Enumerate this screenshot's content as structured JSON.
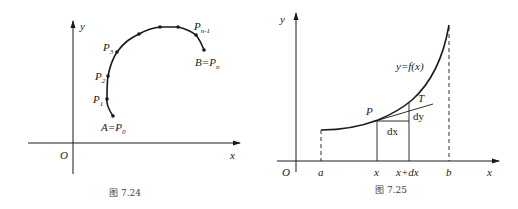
{
  "figures": [
    {
      "caption": "图  7.24",
      "axes": {
        "origin_label": "O",
        "x_label": "x",
        "y_label": "y"
      },
      "points": [
        {
          "name": "A=P0",
          "label_main": "A=P",
          "label_sub": "0"
        },
        {
          "name": "P1",
          "label_main": "P",
          "label_sub": "1"
        },
        {
          "name": "P2",
          "label_main": "P",
          "label_sub": "2"
        },
        {
          "name": "P3",
          "label_main": "P",
          "label_sub": "3"
        },
        {
          "name": "Pn-1",
          "label_main": "P",
          "label_sub": "n-1"
        },
        {
          "name": "B=Pn",
          "label_main": "B=P",
          "label_sub": "n"
        }
      ],
      "description": "Curve arc from A to B subdivided by points P0, P1, ..., Pn"
    },
    {
      "caption": "图  7.25",
      "axes": {
        "origin_label": "O",
        "x_label": "x",
        "y_label": "y"
      },
      "x_ticks": [
        "a",
        "x",
        "x+dx",
        "b"
      ],
      "curve_label": "y=f(x)",
      "point_label": "P",
      "tangent_label": "T",
      "dx_label": "dx",
      "dy_label": "dy",
      "description": "Increasing curve y=f(x) on [a,b] with tangent at P showing dx and dy"
    }
  ],
  "colors": {
    "stroke": "#1a1a1a",
    "caption": "#444444",
    "background": "#ffffff"
  }
}
